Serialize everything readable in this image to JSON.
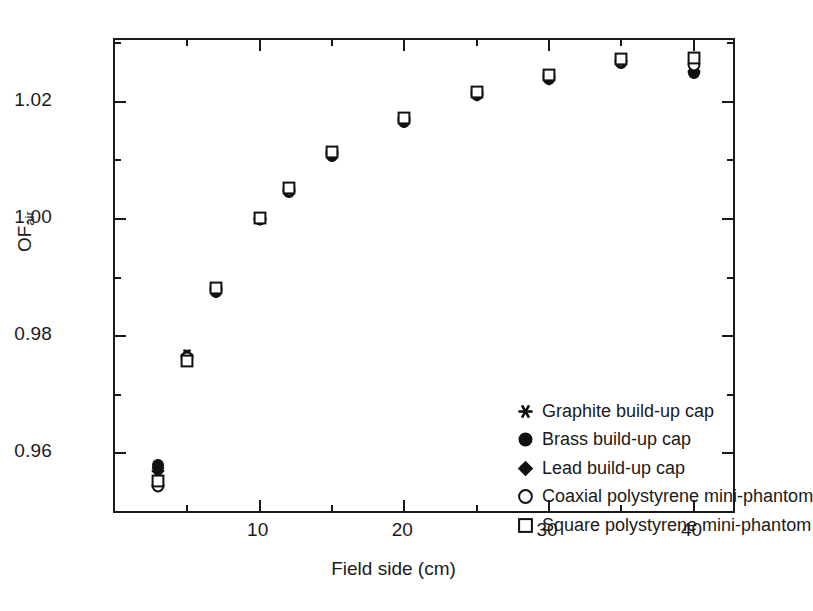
{
  "chart_data": {
    "type": "scatter",
    "title": "",
    "xlabel": "Field side (cm)",
    "ylabel": "OF",
    "ylabel_sub": "air",
    "xlim": [
      0,
      43
    ],
    "ylim": [
      0.9495,
      1.0305
    ],
    "grid": false,
    "legend_position": "inside-lower-right",
    "x_ticks_major": [
      10,
      20,
      30,
      40
    ],
    "x_ticks_major_labels": [
      "10",
      "20",
      "30",
      "40"
    ],
    "x_ticks_minor": [
      5,
      15,
      25,
      35
    ],
    "y_ticks_major": [
      0.96,
      0.98,
      1.0,
      1.02
    ],
    "y_ticks_major_labels": [
      "0.96",
      "0.98",
      "1.00",
      "1.02"
    ],
    "y_ticks_minor": [
      0.95,
      0.97,
      0.99,
      1.01,
      1.03
    ],
    "x": [
      3,
      5,
      7,
      10,
      12,
      15,
      20,
      25,
      30,
      35,
      40
    ],
    "series": [
      {
        "name": "Graphite build-up cap",
        "marker": "asterisk",
        "filled": true,
        "color": "#111111",
        "values": [
          0.9575,
          0.9768,
          0.9878,
          1.0,
          1.0048,
          1.011,
          1.0168,
          1.0213,
          1.024,
          1.0268,
          1.0252
        ]
      },
      {
        "name": "Brass build-up cap",
        "marker": "circle",
        "filled": true,
        "color": "#111111",
        "values": [
          0.958,
          0.9765,
          0.9876,
          0.9999,
          1.0046,
          1.0108,
          1.0166,
          1.0211,
          1.0238,
          1.0266,
          1.0248
        ]
      },
      {
        "name": "Lead build-up cap",
        "marker": "diamond",
        "filled": true,
        "color": "#111111",
        "values": [
          0.957,
          0.9766,
          0.9877,
          1.0,
          1.0047,
          1.0109,
          1.0167,
          1.0212,
          1.0239,
          1.0267,
          1.025
        ]
      },
      {
        "name": "Coaxial polystyrene mini-phantom",
        "marker": "circle",
        "filled": false,
        "color": "#111111",
        "values": [
          0.9545,
          0.9762,
          0.988,
          1.0,
          1.005,
          1.0112,
          1.017,
          1.0215,
          1.0243,
          1.027,
          1.0262
        ]
      },
      {
        "name": "Square polystyrene mini-phantom",
        "marker": "square",
        "filled": false,
        "color": "#111111",
        "values": [
          0.9553,
          0.9758,
          0.9882,
          1.0002,
          1.0052,
          1.0114,
          1.0172,
          1.0217,
          1.0245,
          1.0272,
          1.0275
        ]
      }
    ]
  },
  "legend": {
    "entries": [
      {
        "label": "Graphite build-up cap",
        "marker": "asterisk-marker"
      },
      {
        "label": "Brass build-up cap",
        "marker": "filled-circle-marker"
      },
      {
        "label": "Lead build-up cap",
        "marker": "filled-diamond-marker"
      },
      {
        "label": "Coaxial polystyrene mini-phantom",
        "marker": "open-circle-marker"
      },
      {
        "label": "Square polystyrene mini-phantom",
        "marker": "open-square-marker"
      }
    ]
  }
}
